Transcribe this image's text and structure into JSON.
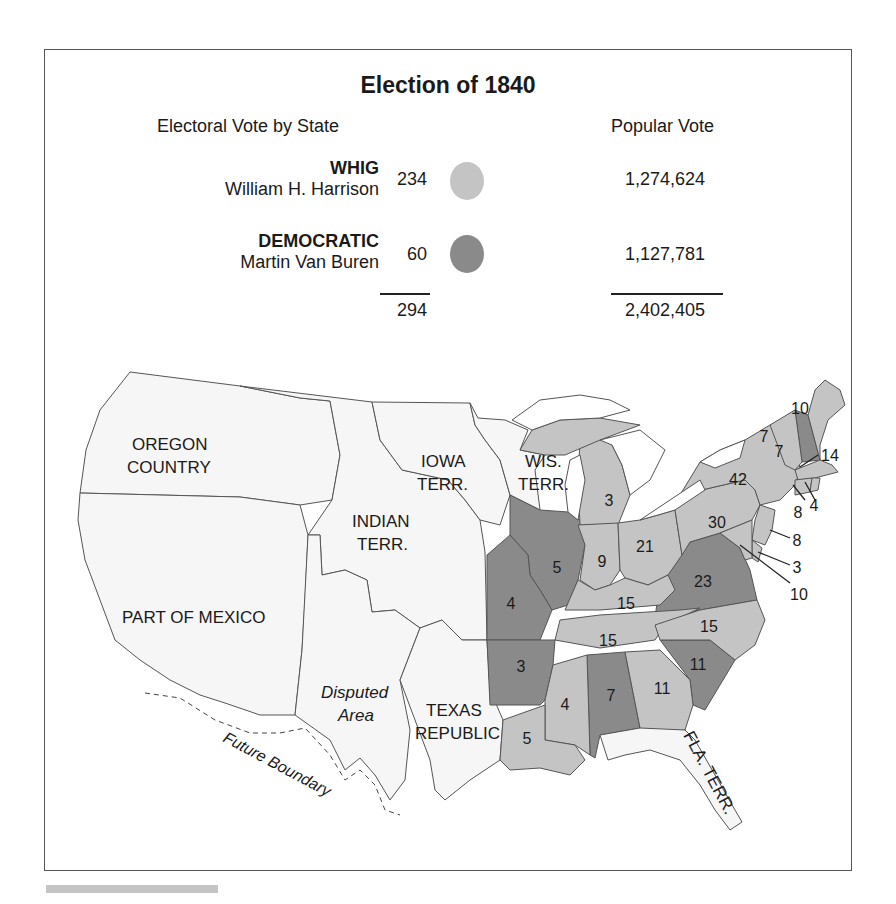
{
  "title": "Election of 1840",
  "headers": {
    "electoral": "Electoral Vote by State",
    "popular": "Popular Vote"
  },
  "parties": [
    {
      "party": "WHIG",
      "candidate": "William H. Harrison",
      "electoral": "234",
      "popular": "1,274,624",
      "color": "#c4c4c4"
    },
    {
      "party": "DEMOCRATIC",
      "candidate": "Martin Van Buren",
      "electoral": "60",
      "popular": "1,127,781",
      "color": "#8a8a8a"
    }
  ],
  "totals": {
    "electoral": "294",
    "popular": "2,402,405"
  },
  "colors": {
    "whig": "#c4c4c4",
    "democratic": "#8a8a8a",
    "territory": "#f6f6f6",
    "border": "#555555"
  },
  "map": {
    "region_labels": {
      "oregon_1": "OREGON",
      "oregon_2": "COUNTRY",
      "iowa_1": "IOWA",
      "iowa_2": "TERR.",
      "wis_1": "WIS.",
      "wis_2": "TERR.",
      "indian_1": "INDIAN",
      "indian_2": "TERR.",
      "mexico": "PART OF MEXICO",
      "disputed_1": "Disputed",
      "disputed_2": "Area",
      "texas_1": "TEXAS",
      "texas_2": "REPUBLIC",
      "florida": "FLA. TERR.",
      "future_boundary": "Future Boundary"
    },
    "states": [
      {
        "name": "Maine",
        "votes": "10",
        "party": "whig"
      },
      {
        "name": "New Hampshire",
        "votes": "7",
        "party": "democratic"
      },
      {
        "name": "Vermont",
        "votes": "7",
        "party": "whig"
      },
      {
        "name": "Massachusetts",
        "votes": "14",
        "party": "whig"
      },
      {
        "name": "Rhode Island",
        "votes": "4",
        "party": "whig"
      },
      {
        "name": "Connecticut",
        "votes": "8",
        "party": "whig"
      },
      {
        "name": "New York",
        "votes": "42",
        "party": "whig"
      },
      {
        "name": "New Jersey",
        "votes": "8",
        "party": "whig"
      },
      {
        "name": "Pennsylvania",
        "votes": "30",
        "party": "whig"
      },
      {
        "name": "Delaware",
        "votes": "3",
        "party": "whig"
      },
      {
        "name": "Maryland",
        "votes": "10",
        "party": "whig"
      },
      {
        "name": "Virginia",
        "votes": "23",
        "party": "democratic"
      },
      {
        "name": "North Carolina",
        "votes": "15",
        "party": "whig"
      },
      {
        "name": "South Carolina",
        "votes": "11",
        "party": "democratic"
      },
      {
        "name": "Georgia",
        "votes": "11",
        "party": "whig"
      },
      {
        "name": "Alabama",
        "votes": "7",
        "party": "democratic"
      },
      {
        "name": "Mississippi",
        "votes": "4",
        "party": "whig"
      },
      {
        "name": "Louisiana",
        "votes": "5",
        "party": "whig"
      },
      {
        "name": "Tennessee",
        "votes": "15",
        "party": "whig"
      },
      {
        "name": "Kentucky",
        "votes": "15",
        "party": "whig"
      },
      {
        "name": "Ohio",
        "votes": "21",
        "party": "whig"
      },
      {
        "name": "Indiana",
        "votes": "9",
        "party": "whig"
      },
      {
        "name": "Illinois",
        "votes": "5",
        "party": "democratic"
      },
      {
        "name": "Michigan",
        "votes": "3",
        "party": "whig"
      },
      {
        "name": "Missouri",
        "votes": "4",
        "party": "democratic"
      },
      {
        "name": "Arkansas",
        "votes": "3",
        "party": "democratic"
      }
    ]
  }
}
